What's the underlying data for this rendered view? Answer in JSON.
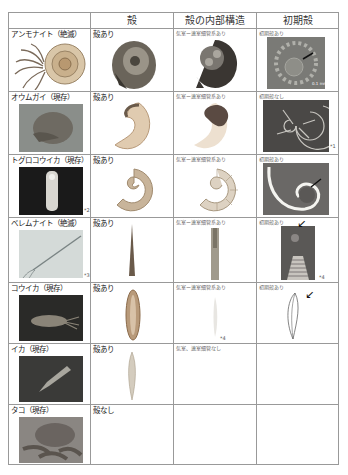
{
  "table": {
    "headers": [
      "",
      "殻",
      "殻の内部構造",
      "初期殻"
    ],
    "rows": [
      {
        "name": "アンモナイト（絶滅）",
        "shell": "殻あり",
        "internal": "気室ー連室細管系あり",
        "initial": "初期殻あり",
        "scale": "0.1 mm",
        "note": ""
      },
      {
        "name": "オウムガイ（現存）",
        "shell": "殻あり",
        "internal": "気室ー連室細管系あり",
        "initial": "初期殻なし",
        "note": "*1"
      },
      {
        "name": "トグロコウイカ（現存）",
        "shell": "殻あり",
        "internal": "気室ー連室細管系あり",
        "initial": "初期殻あり",
        "note": "*2"
      },
      {
        "name": "ベレムナイト（絶滅）",
        "shell": "殻あり",
        "internal": "気室ー連室細管系あり",
        "initial": "初期殻あり",
        "note": "*3",
        "note2": "*4"
      },
      {
        "name": "コウイカ（現存）",
        "shell": "殻あり",
        "internal": "気室ー連室細管系あり",
        "initial": "初期殻あり",
        "note": "*4"
      },
      {
        "name": "イカ（現存）",
        "shell": "殻あり",
        "internal": "気室、連室細管なし",
        "initial": ""
      },
      {
        "name": "タコ（現存）",
        "shell": "殻なし",
        "internal": "",
        "initial": ""
      }
    ]
  },
  "colors": {
    "border": "#999999",
    "text": "#222222"
  }
}
